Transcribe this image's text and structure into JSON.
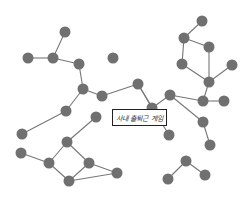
{
  "diagram": {
    "type": "network-graph",
    "label": "사내 출퇴근 게임",
    "node_color": "#707070",
    "edge_color": "#777777",
    "nodes": [
      {
        "id": "n1",
        "x": 65,
        "y": 32
      },
      {
        "id": "n2",
        "x": 28,
        "y": 58
      },
      {
        "id": "n3",
        "x": 53,
        "y": 58
      },
      {
        "id": "n4",
        "x": 79,
        "y": 64
      },
      {
        "id": "n5",
        "x": 113,
        "y": 58
      },
      {
        "id": "n6",
        "x": 83,
        "y": 89
      },
      {
        "id": "n7",
        "x": 102,
        "y": 96
      },
      {
        "id": "n8",
        "x": 138,
        "y": 84
      },
      {
        "id": "n9",
        "x": 152,
        "y": 108
      },
      {
        "id": "n10",
        "x": 170,
        "y": 95
      },
      {
        "id": "n11",
        "x": 202,
        "y": 21
      },
      {
        "id": "n12",
        "x": 184,
        "y": 38
      },
      {
        "id": "n13",
        "x": 209,
        "y": 47
      },
      {
        "id": "n14",
        "x": 182,
        "y": 64
      },
      {
        "id": "n15",
        "x": 232,
        "y": 65
      },
      {
        "id": "n16",
        "x": 209,
        "y": 82
      },
      {
        "id": "n17",
        "x": 203,
        "y": 101
      },
      {
        "id": "n18",
        "x": 224,
        "y": 101
      },
      {
        "id": "n19",
        "x": 203,
        "y": 122
      },
      {
        "id": "n20",
        "x": 210,
        "y": 145
      },
      {
        "id": "n21",
        "x": 169,
        "y": 135
      },
      {
        "id": "n22",
        "x": 186,
        "y": 161
      },
      {
        "id": "n23",
        "x": 168,
        "y": 179
      },
      {
        "id": "n24",
        "x": 205,
        "y": 175
      },
      {
        "id": "n25",
        "x": 66,
        "y": 111
      },
      {
        "id": "n26",
        "x": 22,
        "y": 134
      },
      {
        "id": "n27",
        "x": 96,
        "y": 117
      },
      {
        "id": "n28",
        "x": 67,
        "y": 142
      },
      {
        "id": "n29",
        "x": 21,
        "y": 153
      },
      {
        "id": "n30",
        "x": 49,
        "y": 163
      },
      {
        "id": "n31",
        "x": 89,
        "y": 163
      },
      {
        "id": "n32",
        "x": 69,
        "y": 181
      },
      {
        "id": "n33",
        "x": 117,
        "y": 173
      }
    ],
    "edges": [
      [
        "n1",
        "n3"
      ],
      [
        "n2",
        "n3"
      ],
      [
        "n3",
        "n4"
      ],
      [
        "n4",
        "n6"
      ],
      [
        "n6",
        "n7"
      ],
      [
        "n7",
        "n8"
      ],
      [
        "n8",
        "n9"
      ],
      [
        "n9",
        "n10"
      ],
      [
        "n10",
        "n17"
      ],
      [
        "n10",
        "n19"
      ],
      [
        "n19",
        "n20"
      ],
      [
        "n11",
        "n12"
      ],
      [
        "n12",
        "n13"
      ],
      [
        "n12",
        "n14"
      ],
      [
        "n13",
        "n16"
      ],
      [
        "n14",
        "n16"
      ],
      [
        "n15",
        "n16"
      ],
      [
        "n16",
        "n17"
      ],
      [
        "n17",
        "n18"
      ],
      [
        "n6",
        "n25"
      ],
      [
        "n25",
        "n26"
      ],
      [
        "n27",
        "n28"
      ],
      [
        "n28",
        "n30"
      ],
      [
        "n28",
        "n31"
      ],
      [
        "n29",
        "n30"
      ],
      [
        "n30",
        "n32"
      ],
      [
        "n31",
        "n32"
      ],
      [
        "n31",
        "n33"
      ],
      [
        "n32",
        "n33"
      ],
      [
        "n22",
        "n23"
      ],
      [
        "n22",
        "n24"
      ],
      [
        "n8",
        "n21"
      ]
    ]
  }
}
